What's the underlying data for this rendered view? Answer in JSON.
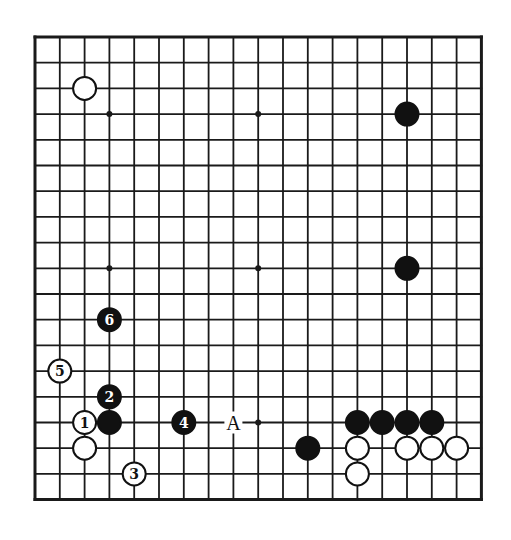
{
  "board": {
    "size": 19,
    "origin_x": 35,
    "origin_y": 37,
    "spacing_x": 24.8,
    "spacing_y": 25.7,
    "line_color": "#1a1a1a",
    "background": "#ffffff",
    "star_points": [
      [
        3,
        3
      ],
      [
        9,
        3
      ],
      [
        15,
        3
      ],
      [
        3,
        9
      ],
      [
        9,
        9
      ],
      [
        15,
        9
      ],
      [
        3,
        15
      ],
      [
        9,
        15
      ],
      [
        15,
        15
      ]
    ]
  },
  "stones": [
    {
      "color": "white",
      "col": 2,
      "row": 2,
      "label": ""
    },
    {
      "color": "black",
      "col": 15,
      "row": 3,
      "label": ""
    },
    {
      "color": "black",
      "col": 15,
      "row": 9,
      "label": ""
    },
    {
      "color": "black",
      "col": 3,
      "row": 11,
      "label": "6"
    },
    {
      "color": "white",
      "col": 1,
      "row": 13,
      "label": "5"
    },
    {
      "color": "black",
      "col": 3,
      "row": 14,
      "label": "2"
    },
    {
      "color": "white",
      "col": 2,
      "row": 15,
      "label": "1"
    },
    {
      "color": "black",
      "col": 3,
      "row": 15,
      "label": ""
    },
    {
      "color": "black",
      "col": 6,
      "row": 15,
      "label": "4"
    },
    {
      "color": "black",
      "col": 13,
      "row": 15,
      "label": ""
    },
    {
      "color": "black",
      "col": 14,
      "row": 15,
      "label": ""
    },
    {
      "color": "black",
      "col": 15,
      "row": 15,
      "label": ""
    },
    {
      "color": "black",
      "col": 16,
      "row": 15,
      "label": ""
    },
    {
      "color": "white",
      "col": 2,
      "row": 16,
      "label": ""
    },
    {
      "color": "black",
      "col": 11,
      "row": 16,
      "label": ""
    },
    {
      "color": "white",
      "col": 13,
      "row": 16,
      "label": ""
    },
    {
      "color": "white",
      "col": 15,
      "row": 16,
      "label": ""
    },
    {
      "color": "white",
      "col": 16,
      "row": 16,
      "label": ""
    },
    {
      "color": "white",
      "col": 17,
      "row": 16,
      "label": ""
    },
    {
      "color": "white",
      "col": 4,
      "row": 17,
      "label": "3"
    },
    {
      "color": "white",
      "col": 13,
      "row": 17,
      "label": ""
    }
  ],
  "labels": [
    {
      "text": "A",
      "col": 8,
      "row": 15
    }
  ]
}
